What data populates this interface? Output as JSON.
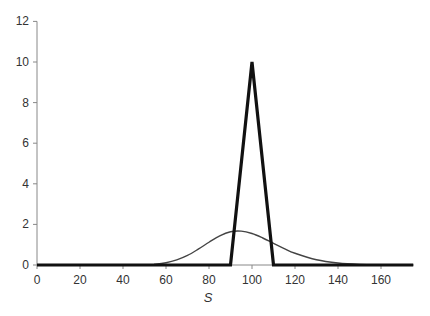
{
  "chart_data": {
    "type": "line",
    "title": "",
    "xlabel": "S",
    "ylabel": "",
    "xlim": [
      0,
      175
    ],
    "ylim": [
      0,
      12
    ],
    "x_ticks": [
      0,
      20,
      40,
      60,
      80,
      100,
      120,
      140,
      160
    ],
    "y_ticks": [
      0,
      2,
      4,
      6,
      8,
      10,
      12
    ],
    "grid": false,
    "legend": null,
    "series": [
      {
        "name": "triangular",
        "style": "thick black line",
        "color": "#111111",
        "x": [
          0,
          90,
          100,
          110,
          175
        ],
        "y": [
          0,
          0,
          10,
          0,
          0
        ]
      },
      {
        "name": "lognormal",
        "style": "thin dark gray line",
        "color": "#444444",
        "x": [
          0,
          50,
          55,
          60,
          65,
          70,
          75,
          80,
          85,
          90,
          95,
          100,
          105,
          110,
          115,
          120,
          130,
          140,
          150,
          160,
          175
        ],
        "y": [
          0,
          0.01,
          0.04,
          0.11,
          0.25,
          0.47,
          0.78,
          1.12,
          1.44,
          1.64,
          1.67,
          1.55,
          1.33,
          1.07,
          0.81,
          0.58,
          0.26,
          0.1,
          0.03,
          0.01,
          0.0
        ]
      }
    ]
  }
}
